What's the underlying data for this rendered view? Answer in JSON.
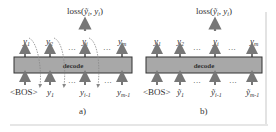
{
  "panels": [
    {
      "id": "a",
      "caption": "a)",
      "decoder_label": "decode",
      "loss_label": "loss(ỹᵢ, yᵢ)",
      "outputs": [
        "y₁",
        "y₂",
        "···",
        "yᵢ",
        "···",
        "yₘ"
      ],
      "inputs": [
        "<BOS>",
        "y₁",
        "···",
        "yᵢ₋₁",
        "···",
        "yₘ₋₁"
      ],
      "feedback": "dashed curved arrows from each output to the next input"
    },
    {
      "id": "b",
      "caption": "b)",
      "decoder_label": "decode",
      "loss_label": "loss(ỹᵢ, yᵢ)",
      "outputs": [
        "y₁",
        "y₂",
        "···",
        "yᵢ",
        "···",
        "yₘ"
      ],
      "inputs": [
        "<BOS>",
        "ỹ₁",
        "···",
        "ỹᵢ₋₁",
        "···",
        "ỹₘ₋₁"
      ],
      "feedback": "none"
    }
  ],
  "colors": {
    "decoder_fill": "#a8a8a8",
    "decoder_stroke": "#333333",
    "arrow": "#777777",
    "frame_line": "#e0e0e0"
  }
}
